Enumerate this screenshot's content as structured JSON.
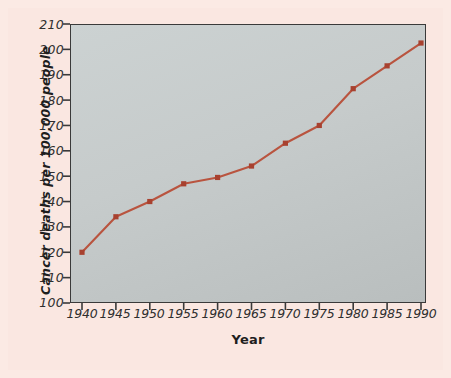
{
  "figure": {
    "background_color": "#fbeae4",
    "plot_background_color": "#c6cbcb",
    "frame_color": "#3a3a3a"
  },
  "chart_data": {
    "type": "line",
    "title": "",
    "subtitle": "",
    "xlabel": "Year",
    "ylabel": "Cancer deaths per 100,000 people",
    "x": [
      1940,
      1945,
      1950,
      1955,
      1960,
      1965,
      1970,
      1975,
      1980,
      1985,
      1990
    ],
    "values": [
      120,
      134,
      140,
      147,
      149.5,
      154,
      163,
      170,
      184.5,
      193.5,
      202.5
    ],
    "series": [
      {
        "name": "Cancer deaths per 100,000 people",
        "color": "#b9543f",
        "marker": "square",
        "values": [
          120,
          134,
          140,
          147,
          149.5,
          154,
          163,
          170,
          184.5,
          193.5,
          202.5
        ]
      }
    ],
    "xtick_labels": [
      "1940",
      "1945",
      "1950",
      "1955",
      "1960",
      "1965",
      "1970",
      "1975",
      "1980",
      "1985",
      "1990"
    ],
    "ytick_labels": [
      "100",
      "110",
      "120",
      "130",
      "140",
      "150",
      "160",
      "170",
      "180",
      "190",
      "200",
      "210"
    ],
    "ytick_values": [
      100,
      110,
      120,
      130,
      140,
      150,
      160,
      170,
      180,
      190,
      200,
      210
    ],
    "xlim": [
      1938,
      1992
    ],
    "ylim": [
      100,
      210
    ],
    "grid": false,
    "legend": false,
    "legend_position": "none",
    "line_color": "#b9543f",
    "marker_color": "#a8412f"
  }
}
